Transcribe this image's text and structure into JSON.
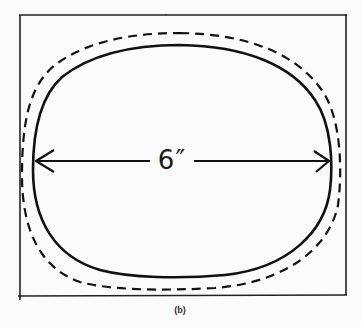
{
  "figure": {
    "caption": "(b)",
    "dimension_label": "6″",
    "elements": [
      {
        "type": "frame",
        "description": "rectangular border box"
      },
      {
        "type": "outline-solid",
        "description": "inner solid rounded oval outline"
      },
      {
        "type": "outline-dashed",
        "description": "outer dashed rounded oval outline"
      },
      {
        "type": "dimension-arrow",
        "description": "double-headed horizontal arrow spanning the solid outline width"
      }
    ],
    "colors": {
      "stroke": "#111111",
      "background": "#fbfbfb"
    }
  }
}
